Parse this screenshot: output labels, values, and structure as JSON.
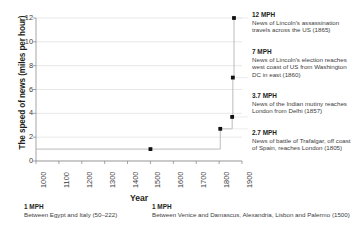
{
  "chart_data": {
    "type": "line",
    "title": "",
    "xlabel": "Year",
    "ylabel": "The speed of news (miles per hour)",
    "xlim": [
      1000,
      1900
    ],
    "ylim": [
      0,
      12
    ],
    "grid": true,
    "legend_position": "none",
    "x_ticks": [
      "1000",
      "1100",
      "1200",
      "1300",
      "1400",
      "1500",
      "1600",
      "1700",
      "1800",
      "1900"
    ],
    "y_ticks": [
      "0",
      "2",
      "4",
      "6",
      "8",
      "10",
      "12"
    ],
    "line_style": "step",
    "x": [
      1000,
      1500,
      1805,
      1857,
      1860,
      1865
    ],
    "values": [
      1,
      1,
      2.7,
      3.7,
      7,
      12
    ],
    "points": [
      {
        "x": 1500,
        "y": 1,
        "label": "1 MPH"
      },
      {
        "x": 1805,
        "y": 2.7,
        "label": "2.7 MPH"
      },
      {
        "x": 1857,
        "y": 3.7,
        "label": "3.7 MPH"
      },
      {
        "x": 1860,
        "y": 7,
        "label": "7 MPH"
      },
      {
        "x": 1865,
        "y": 12,
        "label": "12 MPH"
      }
    ],
    "annotations": [
      {
        "value": "12 MPH",
        "text": "News of Lincoln's assassination travels across the US (1865)",
        "year": 1865,
        "y": 12
      },
      {
        "value": "7 MPH",
        "text": "News of Lincoln's election reaches west coast of US from Washington DC in east (1860)",
        "year": 1860,
        "y": 7
      },
      {
        "value": "3.7 MPH",
        "text": "News of the Indian mutiny reaches London from Delhi (1857)",
        "year": 1857,
        "y": 3.7
      },
      {
        "value": "2.7 MPH",
        "text": "News of battle of Trafalgar, off coast of Spain, reaches London (1805)",
        "year": 1805,
        "y": 2.7
      }
    ],
    "bottom_annotations": [
      {
        "value": "1 MPH",
        "text": "Between Egypt and Italy (50–222)"
      },
      {
        "value": "1 MPH",
        "text": "Between Venice and Damascus, Alexandria, Lisbon and Palermo (1500)"
      }
    ],
    "colors": {
      "line": "#b3b3b3",
      "marker": "#111111",
      "grid": "#d9d9d9",
      "axis": "#808080",
      "text": "#231f20"
    }
  }
}
